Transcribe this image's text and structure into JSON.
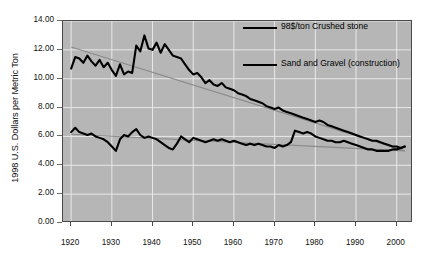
{
  "chart_data": {
    "type": "line",
    "title": "",
    "xlabel": "",
    "ylabel": "1998 U.S. Dollars per Metric Ton",
    "xlim": [
      1918,
      2004
    ],
    "ylim": [
      0,
      14
    ],
    "xticks": [
      1920,
      1930,
      1940,
      1950,
      1960,
      1970,
      1980,
      1990,
      2000
    ],
    "yticks": [
      "0.00",
      "2.00",
      "4.00",
      "6.00",
      "8.00",
      "10.00",
      "12.00",
      "14.00"
    ],
    "ytick_values": [
      0,
      2,
      4,
      6,
      8,
      10,
      12,
      14
    ],
    "grid": true,
    "legend_position": "upper-right-inside",
    "plot_background": "#b6b6b6",
    "series": [
      {
        "name": "98$/ton Crushed stone",
        "color": "#000000",
        "x": [
          1920,
          1921,
          1922,
          1923,
          1924,
          1925,
          1926,
          1927,
          1928,
          1929,
          1930,
          1931,
          1932,
          1933,
          1934,
          1935,
          1936,
          1937,
          1938,
          1939,
          1940,
          1941,
          1942,
          1943,
          1944,
          1945,
          1946,
          1947,
          1948,
          1949,
          1950,
          1951,
          1952,
          1953,
          1954,
          1955,
          1956,
          1957,
          1958,
          1959,
          1960,
          1961,
          1962,
          1963,
          1964,
          1965,
          1966,
          1967,
          1968,
          1969,
          1970,
          1971,
          1972,
          1973,
          1974,
          1975,
          1976,
          1977,
          1978,
          1979,
          1980,
          1981,
          1982,
          1983,
          1984,
          1985,
          1986,
          1987,
          1988,
          1989,
          1990,
          1991,
          1992,
          1993,
          1994,
          1995,
          1996,
          1997,
          1998,
          1999,
          2000,
          2001,
          2002
        ],
        "values": [
          10.7,
          11.5,
          11.4,
          11.1,
          11.6,
          11.2,
          10.9,
          11.3,
          10.8,
          11.1,
          10.6,
          10.2,
          11.0,
          10.3,
          10.5,
          10.4,
          12.3,
          11.9,
          13.0,
          12.1,
          12.0,
          12.5,
          11.8,
          12.4,
          12.0,
          11.6,
          11.5,
          11.4,
          11.0,
          10.6,
          10.3,
          10.4,
          10.1,
          9.7,
          9.9,
          9.6,
          9.5,
          9.7,
          9.4,
          9.3,
          9.2,
          9.0,
          8.9,
          8.8,
          8.6,
          8.5,
          8.4,
          8.3,
          8.1,
          8.0,
          7.9,
          8.0,
          7.8,
          7.7,
          7.6,
          7.5,
          7.4,
          7.3,
          7.2,
          7.1,
          7.0,
          7.1,
          7.0,
          6.8,
          6.7,
          6.6,
          6.5,
          6.4,
          6.3,
          6.2,
          6.1,
          6.0,
          5.9,
          5.8,
          5.7,
          5.7,
          5.6,
          5.5,
          5.4,
          5.3,
          5.3,
          5.2,
          5.3
        ]
      },
      {
        "name": "Sand and Gravel (construction)",
        "color": "#000000",
        "x": [
          1920,
          1921,
          1922,
          1923,
          1924,
          1925,
          1926,
          1927,
          1928,
          1929,
          1930,
          1931,
          1932,
          1933,
          1934,
          1935,
          1936,
          1937,
          1938,
          1939,
          1940,
          1941,
          1942,
          1943,
          1944,
          1945,
          1946,
          1947,
          1948,
          1949,
          1950,
          1951,
          1952,
          1953,
          1954,
          1955,
          1956,
          1957,
          1958,
          1959,
          1960,
          1961,
          1962,
          1963,
          1964,
          1965,
          1966,
          1967,
          1968,
          1969,
          1970,
          1971,
          1972,
          1973,
          1974,
          1975,
          1976,
          1977,
          1978,
          1979,
          1980,
          1981,
          1982,
          1983,
          1984,
          1985,
          1986,
          1987,
          1988,
          1989,
          1990,
          1991,
          1992,
          1993,
          1994,
          1995,
          1996,
          1997,
          1998,
          1999,
          2000,
          2001,
          2002
        ],
        "values": [
          6.3,
          6.6,
          6.3,
          6.2,
          6.1,
          6.2,
          6.0,
          5.9,
          5.8,
          5.6,
          5.3,
          5.0,
          5.8,
          6.1,
          6.0,
          6.3,
          6.5,
          6.1,
          5.9,
          6.0,
          5.9,
          5.8,
          5.6,
          5.4,
          5.2,
          5.1,
          5.5,
          6.0,
          5.8,
          5.6,
          5.9,
          5.8,
          5.7,
          5.6,
          5.7,
          5.8,
          5.7,
          5.8,
          5.7,
          5.6,
          5.7,
          5.6,
          5.5,
          5.4,
          5.5,
          5.4,
          5.5,
          5.4,
          5.3,
          5.3,
          5.2,
          5.4,
          5.3,
          5.4,
          5.6,
          6.4,
          6.3,
          6.2,
          6.3,
          6.2,
          6.0,
          5.9,
          5.8,
          5.7,
          5.7,
          5.6,
          5.6,
          5.7,
          5.6,
          5.5,
          5.4,
          5.3,
          5.2,
          5.1,
          5.1,
          5.0,
          5.0,
          5.0,
          5.0,
          5.1,
          5.1,
          5.2,
          5.3
        ]
      }
    ],
    "trendlines": [
      {
        "name": "crushed-stone-trend",
        "color": "#8a8a8a",
        "x": [
          1920,
          2002
        ],
        "values": [
          12.2,
          5.0
        ]
      },
      {
        "name": "sand-gravel-trend",
        "color": "#8a8a8a",
        "x": [
          1920,
          2002
        ],
        "values": [
          6.15,
          5.0
        ]
      }
    ]
  },
  "legend": {
    "entries": [
      {
        "label": "98$/ton Crushed stone"
      },
      {
        "label": "Sand and Gravel (construction)"
      }
    ]
  },
  "caption": {
    "text": ""
  }
}
